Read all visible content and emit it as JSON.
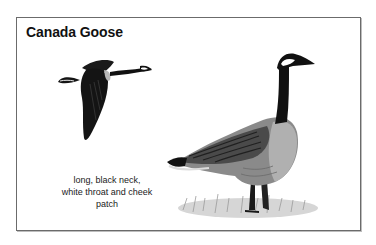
{
  "card": {
    "title": "Canada Goose",
    "caption_lines": [
      "long, black neck,",
      "white throat and cheek",
      "patch"
    ]
  },
  "illustrations": {
    "flying_goose": "flying-goose-illustration",
    "standing_goose": "standing-goose-illustration"
  },
  "colors": {
    "border": "#6b6b6b",
    "text": "#111111",
    "plumage_dark": "#141414",
    "plumage_mid": "#6e6e6e",
    "plumage_light": "#a8a8a8",
    "grass": "#9a9a9a"
  }
}
